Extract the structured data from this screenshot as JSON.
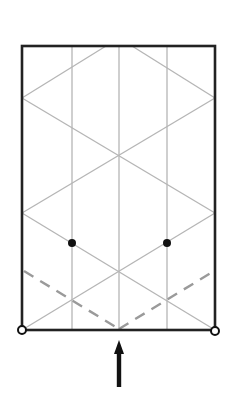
{
  "diagram": {
    "title": "",
    "type": "origami-crease-pattern",
    "colors": {
      "background": "#ffffff",
      "border": "#222222",
      "crease": "#b5b5b5",
      "dashed_fold": "#9a9a9a",
      "dot": "#111111",
      "arrow": "#111111"
    },
    "paper": {
      "x1": 22,
      "y1": 46,
      "x2": 215,
      "y2": 330
    },
    "vertical_creases": [
      72,
      119,
      167
    ],
    "diagonal_creases": [
      {
        "x1": 106,
        "y1": 46,
        "x2": 22,
        "y2": 98
      },
      {
        "x1": 132,
        "y1": 46,
        "x2": 215,
        "y2": 98
      },
      {
        "x1": 22,
        "y1": 98,
        "x2": 215,
        "y2": 213
      },
      {
        "x1": 215,
        "y1": 98,
        "x2": 22,
        "y2": 213
      },
      {
        "x1": 22,
        "y1": 213,
        "x2": 215,
        "y2": 330
      },
      {
        "x1": 215,
        "y1": 213,
        "x2": 22,
        "y2": 330
      }
    ],
    "valley_fold_lines": [
      {
        "x1": 24,
        "y1": 271,
        "x2": 119,
        "y2": 329
      },
      {
        "x1": 119,
        "y1": 329,
        "x2": 214,
        "y2": 271
      }
    ],
    "reference_dots": [
      {
        "x": 72,
        "y": 243
      },
      {
        "x": 167,
        "y": 243
      }
    ],
    "corner_circles": [
      {
        "x": 22,
        "y": 330
      },
      {
        "x": 215,
        "y": 331
      }
    ],
    "push_arrow": {
      "x": 119,
      "tip_y": 340,
      "tail_y": 387,
      "direction": "up"
    }
  }
}
